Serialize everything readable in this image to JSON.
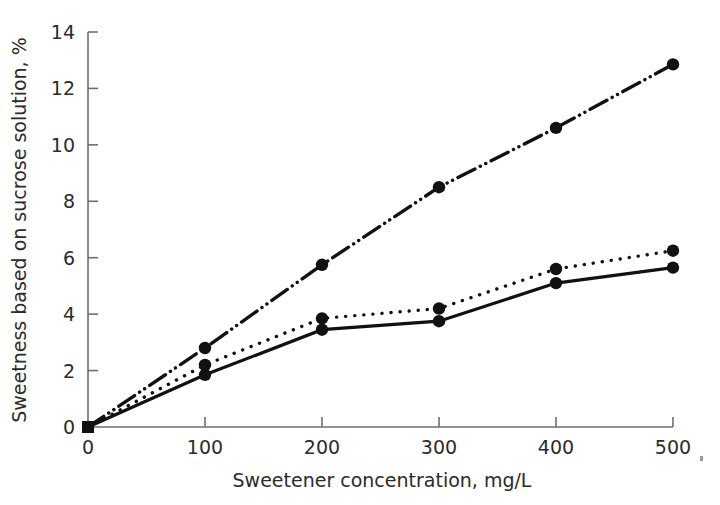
{
  "chart_data": {
    "type": "line",
    "title": "",
    "xlabel": "Sweetener concentration, mg/L",
    "ylabel": "Sweetness based on sucrose solution, %",
    "xlim": [
      0,
      500
    ],
    "ylim": [
      0,
      14
    ],
    "xticks": [
      0,
      100,
      200,
      300,
      400,
      500
    ],
    "yticks": [
      0,
      2,
      4,
      6,
      8,
      10,
      12,
      14
    ],
    "xtick_labels": [
      "0",
      "100",
      "200",
      "300",
      "400",
      "500"
    ],
    "ytick_labels": [
      "0",
      "2",
      "4",
      "6",
      "8",
      "10",
      "12",
      "14"
    ],
    "grid": false,
    "legend": "none",
    "x": [
      0,
      100,
      200,
      300,
      400,
      500
    ],
    "series": [
      {
        "name": "series-dash-dot-dot",
        "linestyle": "dashdotdot",
        "marker": "circle",
        "color": "#111111",
        "values": [
          0,
          2.8,
          5.75,
          8.5,
          10.6,
          12.85
        ]
      },
      {
        "name": "series-dotted",
        "linestyle": "dotted",
        "marker": "circle",
        "color": "#111111",
        "values": [
          0,
          2.2,
          3.85,
          4.2,
          5.6,
          6.25
        ]
      },
      {
        "name": "series-solid",
        "linestyle": "solid",
        "marker": "circle",
        "color": "#111111",
        "values": [
          0,
          1.85,
          3.45,
          3.75,
          5.1,
          5.65
        ]
      }
    ],
    "origin_marker": "square"
  },
  "axes": {
    "x_title": "Sweetener concentration, mg/L",
    "y_title": "Sweetness based on sucrose solution, %"
  },
  "colors": {
    "ink": "#111111",
    "axis": "#6e6e6e",
    "label": "#2b2b2b",
    "background": "#ffffff"
  }
}
